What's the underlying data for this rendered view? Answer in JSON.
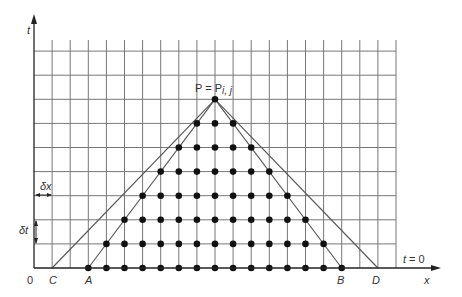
{
  "diagram": {
    "axes": {
      "y_label": "t",
      "x_label": "x",
      "origin_label": "0",
      "baseline_label": "t = 0"
    },
    "step_labels": {
      "dx": "δx",
      "dt": "δt"
    },
    "apex_label": {
      "prefix": "P = P",
      "subscript": "i, j"
    },
    "points": {
      "C": "C",
      "A": "A",
      "B": "B",
      "D": "D"
    },
    "grid": {
      "columns": 20,
      "rows": 9,
      "x0": 34,
      "x_step": 18.1,
      "y0": 268,
      "y_step": 24.1
    },
    "apex_index": {
      "col": 10,
      "row": 7
    },
    "inner_base": {
      "A_col": 3,
      "B_col": 17
    },
    "outer_base": {
      "C_col": 1,
      "D_col": 19
    },
    "line_color": "#555555",
    "dot_color": "#111111"
  }
}
